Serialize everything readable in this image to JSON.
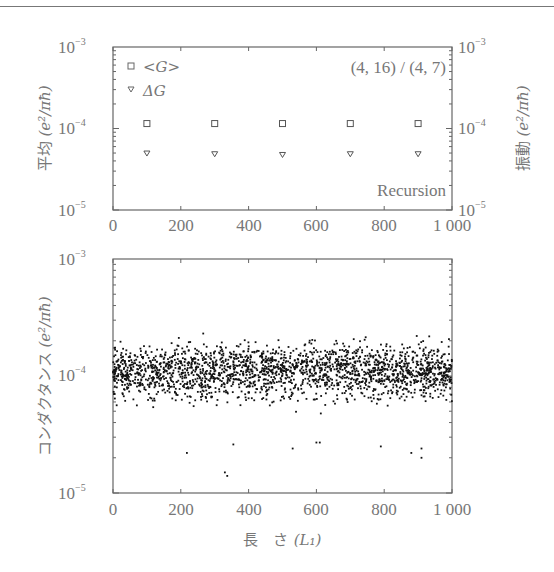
{
  "chart_data": [
    {
      "type": "scatter",
      "title": "",
      "annotation": "(4, 16) / (4, 7)",
      "method_label": "Recursion",
      "xlabel": "",
      "ylabel_left": "平均（e²/πħ）",
      "ylabel_right": "振動（e²/πħ）",
      "xlim": [
        0,
        1000
      ],
      "ylim": [
        1e-05,
        0.001
      ],
      "yscale": "log",
      "x_ticks": [
        "0",
        "200",
        "400",
        "600",
        "800",
        "1 000"
      ],
      "y_ticks": [
        "10^-5",
        "10^-4",
        "10^-3"
      ],
      "legend": [
        {
          "name": "<G>",
          "marker": "square"
        },
        {
          "name": "ΔG",
          "marker": "triangle-down"
        }
      ],
      "series": [
        {
          "name": "<G>",
          "marker": "square",
          "x": [
            100,
            300,
            500,
            700,
            900
          ],
          "values": [
            0.000115,
            0.000115,
            0.000115,
            0.000115,
            0.000115
          ]
        },
        {
          "name": "ΔG",
          "marker": "triangle-down",
          "x": [
            100,
            300,
            500,
            700,
            900
          ],
          "values": [
            5e-05,
            4.9e-05,
            4.8e-05,
            4.9e-05,
            4.9e-05
          ]
        }
      ]
    },
    {
      "type": "scatter",
      "title": "",
      "xlabel": "長 さ（L₁）",
      "ylabel": "コンダクタンス（e²/πħ）",
      "xlim": [
        0,
        1000
      ],
      "ylim": [
        1e-05,
        0.001
      ],
      "yscale": "log",
      "x_ticks": [
        "0",
        "200",
        "400",
        "600",
        "800",
        "1 000"
      ],
      "y_ticks": [
        "10^-5",
        "10^-4",
        "10^-3"
      ],
      "series": [
        {
          "name": "G(L)",
          "marker": "dot",
          "description": "dense scatter of ~2000 points centred near 1.1e-4, spread roughly 3e-5 to 2.8e-4, sparse outliers down to ~1.4e-5",
          "center": 0.00011,
          "upper_envelope": 0.00028,
          "lower_envelope": 3e-05,
          "min_outlier": 1.4e-05
        }
      ]
    }
  ],
  "top_chart": {
    "y_tick_labels": [
      {
        "base": "10",
        "exp": "−3"
      },
      {
        "base": "10",
        "exp": "−4"
      },
      {
        "base": "10",
        "exp": "−5"
      }
    ],
    "x_tick_labels": [
      "0",
      "200",
      "400",
      "600",
      "800",
      "1 000"
    ],
    "ylabel_left": {
      "prefix": "平均",
      "unit": "(e²/πħ)"
    },
    "ylabel_right": {
      "prefix": "振動",
      "unit": "(e²/πħ)"
    },
    "legend_g": "<G>",
    "legend_dg": "ΔG",
    "annotation": "(4, 16) / (4, 7)",
    "method": "Recursion"
  },
  "bottom_chart": {
    "y_tick_labels": [
      {
        "base": "10",
        "exp": "−3"
      },
      {
        "base": "10",
        "exp": "−4"
      },
      {
        "base": "10",
        "exp": "−5"
      }
    ],
    "x_tick_labels": [
      "0",
      "200",
      "400",
      "600",
      "800",
      "1 000"
    ],
    "ylabel": {
      "prefix": "コンダクタンス",
      "unit": "(e²/πħ)"
    },
    "xlabel": {
      "prefix": "長　さ",
      "unit": "(L₁)"
    }
  }
}
